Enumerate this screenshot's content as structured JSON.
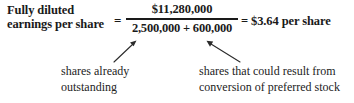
{
  "formula": {
    "left_label": {
      "line1": "Fully diluted",
      "line2": "earnings per share"
    },
    "equals_1": "=",
    "fraction": {
      "numerator": "$11,280,000",
      "denominator": "2,500,000 + 600,000"
    },
    "result": "= $3.64 per share"
  },
  "annotations": {
    "left": {
      "line1": "shares already",
      "line2": "outstanding",
      "arrow": "arrow-up-right"
    },
    "right": {
      "line1": "shares that could result from",
      "line2": "conversion of preferred stock",
      "arrow": "arrow-up-left"
    }
  },
  "colors": {
    "text": "#1a1a1a",
    "caption_text": "#232323",
    "arrow": "#2b2b2b",
    "background": "#ffffff"
  }
}
